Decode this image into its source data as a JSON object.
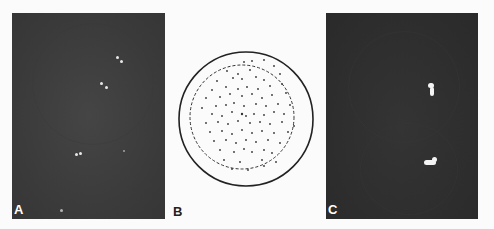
{
  "figure": {
    "panels": [
      {
        "id": "A",
        "label": "A",
        "type": "fluorescence-micrograph",
        "description": "dark field with several small paired bright spots"
      },
      {
        "id": "B",
        "label": "B",
        "type": "schematic",
        "description": "circle with inner dashed circle containing scattered dots"
      },
      {
        "id": "C",
        "label": "C",
        "type": "fluorescence-micrograph",
        "description": "dark field with two bright elongated signals"
      }
    ]
  },
  "panel_a": {
    "label": "A"
  },
  "panel_b": {
    "label": "B"
  },
  "panel_c": {
    "label": "C"
  }
}
